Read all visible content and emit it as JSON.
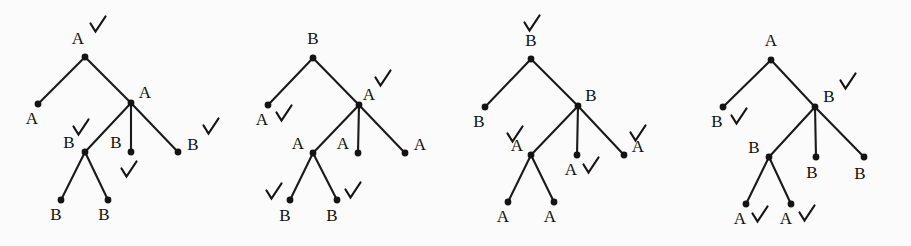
{
  "figure": {
    "kind": "tree-diagram-set",
    "background_color": "#fbfbfb",
    "ink_color": "#141414",
    "label_color": "#111111",
    "width": 911,
    "height": 246,
    "node_radius": 3.4,
    "check_stroke_width": 2.2,
    "edge_stroke_width": 2.1,
    "trees": [
      {
        "id": "tree-1",
        "nodes": [
          {
            "id": "t1-root",
            "label": "A",
            "x": 85,
            "y": 57,
            "label_x": 78,
            "label_y": 44,
            "check": {
              "x": 97,
              "y": 25
            }
          },
          {
            "id": "t1-n2",
            "label": "A",
            "x": 38,
            "y": 104,
            "label_x": 32,
            "label_y": 124,
            "check": null
          },
          {
            "id": "t1-n3",
            "label": "A",
            "x": 131,
            "y": 103,
            "label_x": 145,
            "label_y": 98,
            "check": null
          },
          {
            "id": "t1-n4",
            "label": "B",
            "x": 85,
            "y": 152,
            "label_x": 69,
            "label_y": 148,
            "check": {
              "x": 80,
              "y": 128
            }
          },
          {
            "id": "t1-n5",
            "label": "B",
            "x": 131,
            "y": 152,
            "label_x": 116,
            "label_y": 148,
            "check": {
              "x": 128,
              "y": 170
            }
          },
          {
            "id": "t1-n6",
            "label": "B",
            "x": 178,
            "y": 152,
            "label_x": 193,
            "label_y": 150,
            "check": {
              "x": 210,
              "y": 127
            }
          },
          {
            "id": "t1-n7",
            "label": "B",
            "x": 61,
            "y": 200,
            "label_x": 56,
            "label_y": 220,
            "check": null
          },
          {
            "id": "t1-n8",
            "label": "B",
            "x": 108,
            "y": 200,
            "label_x": 104,
            "label_y": 220,
            "check": null
          }
        ],
        "edges": [
          [
            "t1-root",
            "t1-n2"
          ],
          [
            "t1-root",
            "t1-n3"
          ],
          [
            "t1-n3",
            "t1-n4"
          ],
          [
            "t1-n3",
            "t1-n5"
          ],
          [
            "t1-n3",
            "t1-n6"
          ],
          [
            "t1-n4",
            "t1-n7"
          ],
          [
            "t1-n4",
            "t1-n8"
          ]
        ]
      },
      {
        "id": "tree-2",
        "nodes": [
          {
            "id": "t2-root",
            "label": "B",
            "x": 313,
            "y": 58,
            "label_x": 313,
            "label_y": 44,
            "check": null
          },
          {
            "id": "t2-n2",
            "label": "A",
            "x": 268,
            "y": 105,
            "label_x": 262,
            "label_y": 125,
            "check": {
              "x": 283,
              "y": 114
            }
          },
          {
            "id": "t2-n3",
            "label": "A",
            "x": 359,
            "y": 105,
            "label_x": 369,
            "label_y": 100,
            "check": {
              "x": 382,
              "y": 79
            }
          },
          {
            "id": "t2-n4",
            "label": "A",
            "x": 313,
            "y": 153,
            "label_x": 298,
            "label_y": 149,
            "check": null
          },
          {
            "id": "t2-n5",
            "label": "A",
            "x": 358,
            "y": 153,
            "label_x": 343,
            "label_y": 149,
            "check": null
          },
          {
            "id": "t2-n6",
            "label": "A",
            "x": 405,
            "y": 153,
            "label_x": 420,
            "label_y": 150,
            "check": null
          },
          {
            "id": "t2-n7",
            "label": "B",
            "x": 290,
            "y": 200,
            "label_x": 285,
            "label_y": 221,
            "check": {
              "x": 273,
              "y": 192
            }
          },
          {
            "id": "t2-n8",
            "label": "B",
            "x": 337,
            "y": 200,
            "label_x": 332,
            "label_y": 221,
            "check": {
              "x": 352,
              "y": 191
            }
          }
        ],
        "edges": [
          [
            "t2-root",
            "t2-n2"
          ],
          [
            "t2-root",
            "t2-n3"
          ],
          [
            "t2-n3",
            "t2-n4"
          ],
          [
            "t2-n3",
            "t2-n5"
          ],
          [
            "t2-n3",
            "t2-n6"
          ],
          [
            "t2-n4",
            "t2-n7"
          ],
          [
            "t2-n4",
            "t2-n8"
          ]
        ]
      },
      {
        "id": "tree-3",
        "nodes": [
          {
            "id": "t3-root",
            "label": "B",
            "x": 531,
            "y": 59,
            "label_x": 531,
            "label_y": 46,
            "check": {
              "x": 531,
              "y": 24
            }
          },
          {
            "id": "t3-n2",
            "label": "B",
            "x": 485,
            "y": 107,
            "label_x": 479,
            "label_y": 127,
            "check": null
          },
          {
            "id": "t3-n3",
            "label": "B",
            "x": 578,
            "y": 106,
            "label_x": 591,
            "label_y": 101,
            "check": null
          },
          {
            "id": "t3-n4",
            "label": "A",
            "x": 531,
            "y": 155,
            "label_x": 517,
            "label_y": 151,
            "check": {
              "x": 514,
              "y": 135
            }
          },
          {
            "id": "t3-n5",
            "label": "A",
            "x": 577,
            "y": 155,
            "label_x": 571,
            "label_y": 175,
            "check": {
              "x": 590,
              "y": 166
            }
          },
          {
            "id": "t3-n6",
            "label": "A",
            "x": 624,
            "y": 155,
            "label_x": 638,
            "label_y": 152,
            "check": {
              "x": 637,
              "y": 134
            }
          },
          {
            "id": "t3-n7",
            "label": "A",
            "x": 508,
            "y": 202,
            "label_x": 503,
            "label_y": 222,
            "check": null
          },
          {
            "id": "t3-n8",
            "label": "A",
            "x": 554,
            "y": 202,
            "label_x": 550,
            "label_y": 222,
            "check": null
          }
        ],
        "edges": [
          [
            "t3-root",
            "t3-n2"
          ],
          [
            "t3-root",
            "t3-n3"
          ],
          [
            "t3-n3",
            "t3-n4"
          ],
          [
            "t3-n3",
            "t3-n5"
          ],
          [
            "t3-n3",
            "t3-n6"
          ],
          [
            "t3-n4",
            "t3-n7"
          ],
          [
            "t3-n4",
            "t3-n8"
          ]
        ]
      },
      {
        "id": "tree-4",
        "nodes": [
          {
            "id": "t4-root",
            "label": "A",
            "x": 771,
            "y": 60,
            "label_x": 771,
            "label_y": 46,
            "check": null
          },
          {
            "id": "t4-n2",
            "label": "B",
            "x": 723,
            "y": 107,
            "label_x": 717,
            "label_y": 127,
            "check": {
              "x": 738,
              "y": 117
            }
          },
          {
            "id": "t4-n3",
            "label": "B",
            "x": 815,
            "y": 107,
            "label_x": 829,
            "label_y": 102,
            "check": {
              "x": 847,
              "y": 82
            }
          },
          {
            "id": "t4-n4",
            "label": "B",
            "x": 769,
            "y": 157,
            "label_x": 754,
            "label_y": 153,
            "check": null
          },
          {
            "id": "t4-n5",
            "label": "B",
            "x": 816,
            "y": 157,
            "label_x": 812,
            "label_y": 178,
            "check": null
          },
          {
            "id": "t4-n6",
            "label": "B",
            "x": 864,
            "y": 157,
            "label_x": 860,
            "label_y": 179,
            "check": null
          },
          {
            "id": "t4-n7",
            "label": "A",
            "x": 746,
            "y": 204,
            "label_x": 740,
            "label_y": 224,
            "check": {
              "x": 759,
              "y": 215
            }
          },
          {
            "id": "t4-n8",
            "label": "A",
            "x": 791,
            "y": 204,
            "label_x": 786,
            "label_y": 224,
            "check": {
              "x": 806,
              "y": 214
            }
          }
        ],
        "edges": [
          [
            "t4-root",
            "t4-n2"
          ],
          [
            "t4-root",
            "t4-n3"
          ],
          [
            "t4-n3",
            "t4-n4"
          ],
          [
            "t4-n3",
            "t4-n5"
          ],
          [
            "t4-n3",
            "t4-n6"
          ],
          [
            "t4-n4",
            "t4-n7"
          ],
          [
            "t4-n4",
            "t4-n8"
          ]
        ]
      }
    ]
  }
}
